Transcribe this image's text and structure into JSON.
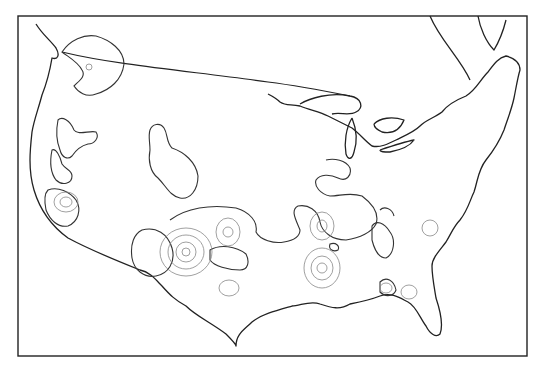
{
  "map": {
    "subject": "Contiguous United States outline with hatched contour regions",
    "labels": [],
    "colors": {
      "line": "#222222",
      "contour_inner": "#888888",
      "background": "#ffffff"
    }
  }
}
